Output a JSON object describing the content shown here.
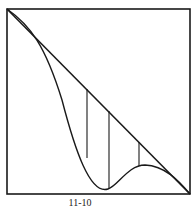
{
  "figure": {
    "label": "11-10",
    "stroke_color": "#1a1a1a",
    "elements": [
      "frame",
      "diagonal-line",
      "curve",
      "vertical-lines"
    ]
  }
}
